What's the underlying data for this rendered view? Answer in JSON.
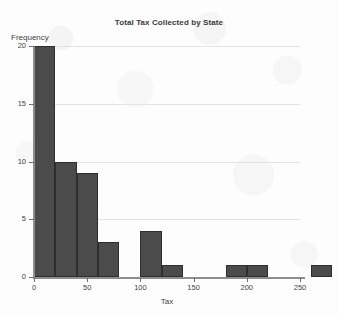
{
  "chart_data": {
    "type": "bar",
    "title": "Total Tax Collected by State",
    "xlabel": "Tax",
    "ylabel": "Frequency",
    "grid": true,
    "legend": "none",
    "xlim": [
      0,
      285
    ],
    "ylim": [
      0,
      20
    ],
    "bin_width": 20,
    "xticks": [
      0,
      50,
      100,
      150,
      200,
      250
    ],
    "xtick_labels": [
      "0",
      "50",
      "100",
      "150",
      "200",
      "250"
    ],
    "yticks": [
      0,
      5,
      10,
      15,
      20
    ],
    "ytick_labels": [
      "0",
      "5",
      "10",
      "15",
      "20"
    ],
    "bins": [
      {
        "start": 0,
        "end": 20,
        "value": 20
      },
      {
        "start": 20,
        "end": 40,
        "value": 10
      },
      {
        "start": 40,
        "end": 60,
        "value": 9
      },
      {
        "start": 60,
        "end": 80,
        "value": 3
      },
      {
        "start": 80,
        "end": 100,
        "value": 0
      },
      {
        "start": 100,
        "end": 120,
        "value": 4
      },
      {
        "start": 120,
        "end": 140,
        "value": 1
      },
      {
        "start": 140,
        "end": 160,
        "value": 0
      },
      {
        "start": 160,
        "end": 180,
        "value": 0
      },
      {
        "start": 180,
        "end": 200,
        "value": 1
      },
      {
        "start": 200,
        "end": 220,
        "value": 1
      },
      {
        "start": 220,
        "end": 240,
        "value": 0
      },
      {
        "start": 240,
        "end": 260,
        "value": 0
      },
      {
        "start": 260,
        "end": 280,
        "value": 1
      }
    ],
    "categories": [
      "0-20",
      "20-40",
      "40-60",
      "60-80",
      "80-100",
      "100-120",
      "120-140",
      "140-160",
      "160-180",
      "180-200",
      "200-220",
      "220-240",
      "240-260",
      "260-280"
    ],
    "values": [
      20,
      10,
      9,
      3,
      0,
      4,
      1,
      0,
      0,
      1,
      1,
      0,
      0,
      1
    ],
    "colors": {
      "bar_fill": "#4b4b4b",
      "bar_edge": "#2e2e2e",
      "gridline": "#e3e3e3",
      "axis": "#8d8d8d",
      "background": "#fdfdfd",
      "text": "#3f3f3f"
    }
  }
}
